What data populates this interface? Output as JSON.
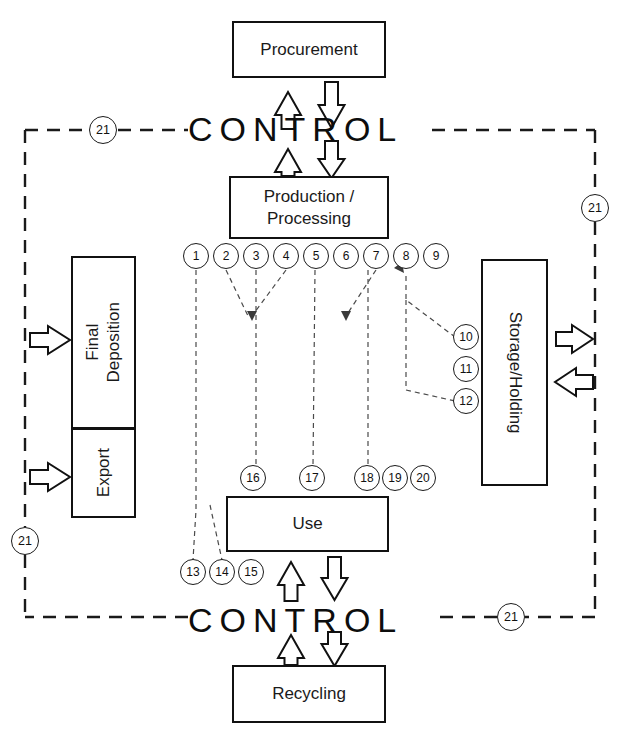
{
  "diagram": {
    "boxes": {
      "procurement": {
        "label": "Procurement"
      },
      "production": {
        "label": "Production /\nProcessing"
      },
      "use": {
        "label": "Use"
      },
      "recycling": {
        "label": "Recycling"
      },
      "final_deposition": {
        "label": "Final\nDeposition"
      },
      "export": {
        "label": "Export"
      },
      "storage": {
        "label": "Storage/Holding"
      }
    },
    "control_top": {
      "label": "CONTROL"
    },
    "control_bottom": {
      "label": "CONTROL"
    },
    "boundary_markers": [
      {
        "id": "21",
        "label": "21",
        "position": "top-left"
      },
      {
        "id": "21",
        "label": "21",
        "position": "right-upper"
      },
      {
        "id": "21",
        "label": "21",
        "position": "left-lower"
      },
      {
        "id": "21",
        "label": "21",
        "position": "bottom-right"
      }
    ],
    "flow_nodes_production_row": [
      {
        "label": "1"
      },
      {
        "label": "2"
      },
      {
        "label": "3"
      },
      {
        "label": "4"
      },
      {
        "label": "5"
      },
      {
        "label": "6"
      },
      {
        "label": "7"
      },
      {
        "label": "8"
      },
      {
        "label": "9"
      }
    ],
    "flow_nodes_storage_column": [
      {
        "label": "10"
      },
      {
        "label": "11"
      },
      {
        "label": "12"
      }
    ],
    "flow_nodes_use_below": [
      {
        "label": "13"
      },
      {
        "label": "14"
      },
      {
        "label": "15"
      }
    ],
    "flow_nodes_use_above": [
      {
        "label": "16"
      },
      {
        "label": "17"
      },
      {
        "label": "18"
      },
      {
        "label": "19"
      },
      {
        "label": "20"
      }
    ],
    "colors": {
      "stroke": "#111111",
      "background": "#ffffff",
      "dashed_boundary": "#1a1a1a"
    }
  }
}
